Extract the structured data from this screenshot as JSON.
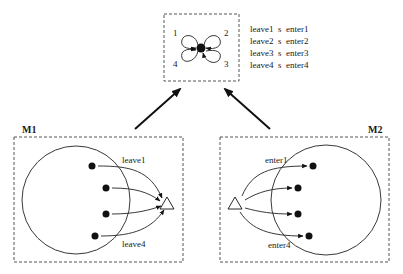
{
  "top_module": {
    "loop_labels": [
      "1",
      "2",
      "3",
      "4"
    ],
    "sync_rules": [
      "leave1  s  enter1",
      "leave2  s  enter2",
      "leave3  s  enter3",
      "leave4  s  enter4"
    ]
  },
  "left_module": {
    "label": "M1",
    "transition_top_label": "leave1",
    "transition_bottom_label": "leave4"
  },
  "right_module": {
    "label": "M2",
    "transition_top_label": "enter1",
    "transition_bottom_label": "enter4"
  },
  "colors": {
    "ink": "#111111",
    "dash": "#555555",
    "background": "#ffffff"
  }
}
